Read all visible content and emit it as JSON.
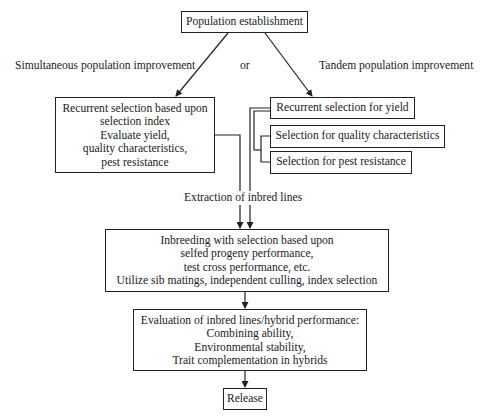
{
  "diagram": {
    "nodes": {
      "population_establishment": {
        "label": "Population establishment"
      },
      "simultaneous_box": {
        "lines": [
          "Recurrent selection based upon",
          "selection index",
          "Evaluate yield,",
          "quality characteristics,",
          "pest resistance"
        ]
      },
      "recurrent_yield": {
        "label": "Recurrent selection for yield"
      },
      "quality": {
        "label": "Selection for quality characteristics"
      },
      "pest": {
        "label": "Selection for pest resistance"
      },
      "inbreeding_box": {
        "lines": [
          "Inbreeding with selection based upon",
          "selfed progeny performance,",
          "test cross performance, etc.",
          "Utilize sib matings, independent culling, index selection"
        ]
      },
      "evaluation_box": {
        "lines": [
          "Evaluation of inbred lines/hybrid performance:",
          "Combining ability,",
          "Environmental stability,",
          "Trait complementation in hybrids"
        ]
      },
      "release": {
        "label": "Release"
      }
    },
    "labels": {
      "simultaneous": "Simultaneous population improvement",
      "or": "or",
      "tandem": "Tandem population improvement",
      "extraction": "Extraction of inbred lines"
    },
    "edges": [
      {
        "from": "population_establishment",
        "to": "simultaneous_box",
        "label": "Simultaneous population improvement"
      },
      {
        "from": "population_establishment",
        "to": "recurrent_yield",
        "label": "Tandem population improvement"
      },
      {
        "from": "simultaneous_box",
        "to": "inbreeding_box",
        "label": "Extraction of inbred lines"
      },
      {
        "from": "recurrent_yield",
        "to": "inbreeding_box"
      },
      {
        "from": "quality",
        "to": "inbreeding_box"
      },
      {
        "from": "pest",
        "to": "inbreeding_box"
      },
      {
        "from": "inbreeding_box",
        "to": "evaluation_box"
      },
      {
        "from": "evaluation_box",
        "to": "release"
      }
    ],
    "colors": {
      "line": "#222222",
      "background": "#ffffff",
      "text": "#1a1a1a"
    }
  }
}
